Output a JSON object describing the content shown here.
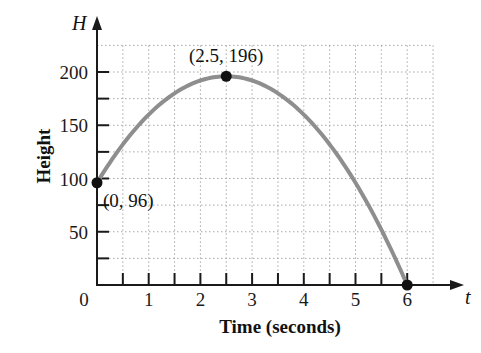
{
  "chart_data": {
    "type": "line",
    "title": "",
    "xlabel": "Time (seconds)",
    "ylabel": "Height",
    "x_var": "t",
    "y_var": "H",
    "xlim": [
      0,
      6.5
    ],
    "ylim": [
      0,
      225
    ],
    "x_ticks": [
      "0",
      "1",
      "2",
      "3",
      "4",
      "5",
      "6"
    ],
    "y_ticks": [
      "50",
      "100",
      "150",
      "200"
    ],
    "grid": true,
    "function": "H = -16t^2 + 80t + 96",
    "series": [
      {
        "name": "H(t)",
        "x": [
          0,
          0.5,
          1,
          1.5,
          2,
          2.5,
          3,
          3.5,
          4,
          4.5,
          5,
          5.5,
          6
        ],
        "values": [
          96,
          132,
          160,
          180,
          192,
          196,
          192,
          180,
          160,
          132,
          96,
          52,
          0
        ]
      }
    ],
    "annotations": [
      {
        "x": 0,
        "y": 96,
        "label": "(0, 96)"
      },
      {
        "x": 2.5,
        "y": 196,
        "label": "(2.5, 196)"
      },
      {
        "x": 6,
        "y": 0,
        "label": ""
      }
    ]
  }
}
